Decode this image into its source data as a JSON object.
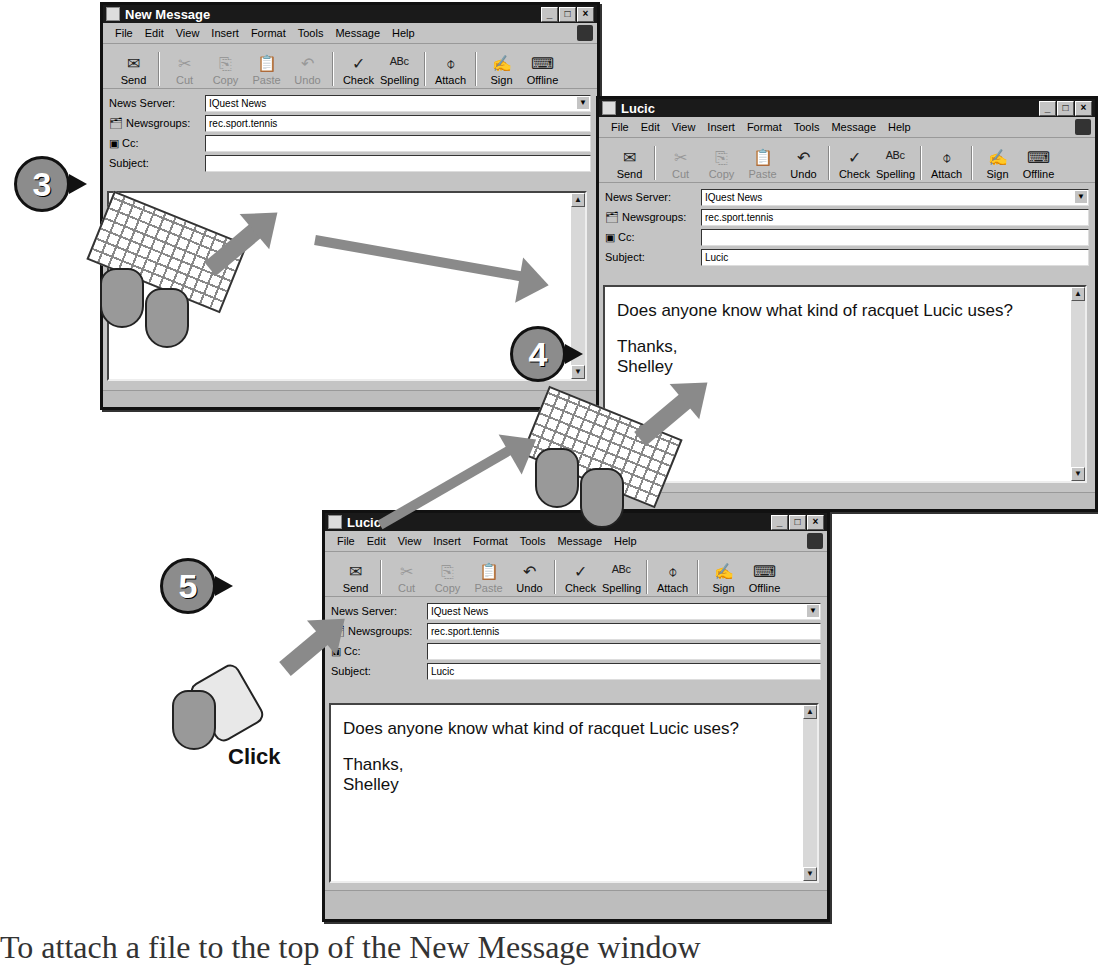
{
  "menu": [
    "File",
    "Edit",
    "View",
    "Insert",
    "Format",
    "Tools",
    "Message",
    "Help"
  ],
  "toolbar": [
    {
      "label": "Send",
      "icon": "send-icon",
      "glyph": "✉",
      "disabled": false
    },
    {
      "label": "Cut",
      "icon": "scissors-icon",
      "glyph": "✂",
      "disabled": true
    },
    {
      "label": "Copy",
      "icon": "copy-icon",
      "glyph": "⎘",
      "disabled": true
    },
    {
      "label": "Paste",
      "icon": "paste-icon",
      "glyph": "📋",
      "disabled": true
    },
    {
      "label": "Undo",
      "icon": "undo-icon",
      "glyph": "↶",
      "disabled": false
    },
    {
      "label": "Check",
      "icon": "check-names-icon",
      "glyph": "✓",
      "disabled": false
    },
    {
      "label": "Spelling",
      "icon": "spelling-icon",
      "glyph": "ᴬᴮᶜ",
      "disabled": false
    },
    {
      "label": "Attach",
      "icon": "paperclip-icon",
      "glyph": "⌽",
      "disabled": false
    },
    {
      "label": "Sign",
      "icon": "sign-icon",
      "glyph": "✍",
      "disabled": false
    },
    {
      "label": "Offline",
      "icon": "offline-icon",
      "glyph": "⌨",
      "disabled": false
    }
  ],
  "fields": {
    "news_server_label": "News Server:",
    "newsgroups_label": "Newsgroups:",
    "cc_label": "Cc:",
    "subject_label": "Subject:"
  },
  "window1": {
    "title": "New Message",
    "news_server": "IQuest News",
    "newsgroups": "rec.sport.tennis",
    "cc": "",
    "subject": "",
    "body_line1": "",
    "body_line2": "",
    "body_line3": ""
  },
  "window2": {
    "title": "Lucic",
    "news_server": "IQuest News",
    "newsgroups": "rec.sport.tennis",
    "cc": "",
    "subject": "Lucic",
    "body_line1": "Does anyone know what kind of racquet Lucic uses?",
    "body_line2": "Thanks,",
    "body_line3": "Shelley"
  },
  "window3": {
    "title": "Lucic",
    "news_server": "IQuest News",
    "newsgroups": "rec.sport.tennis",
    "cc": "",
    "subject": "Lucic",
    "body_line1": "Does anyone know what kind of racquet Lucic uses?",
    "body_line2": "Thanks,",
    "body_line3": "Shelley"
  },
  "steps": {
    "s3": "3",
    "s4": "4",
    "s5": "5"
  },
  "click_label": "Click",
  "caption": "To attach a file to the top of the New Message window"
}
